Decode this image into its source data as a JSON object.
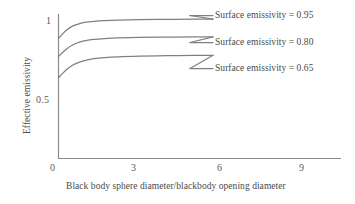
{
  "chart_data": {
    "type": "line",
    "title": "",
    "xlabel": "Black body sphere diameter/blackbody opening diameter",
    "ylabel": "Effective emissivity",
    "xlim": [
      0,
      10.4
    ],
    "ylim": [
      0.4,
      1.06
    ],
    "xticks": [
      0,
      3,
      6,
      9
    ],
    "xtick_labels": [
      "0",
      "3",
      "6",
      "9"
    ],
    "yticks": [
      0.5,
      1
    ],
    "ytick_labels": [
      "0.5",
      "1"
    ],
    "grid": false,
    "legend_position": "inside-right",
    "line_color": "#808080",
    "text_color": "#4a4a4a",
    "axis_color": "#808080",
    "series": [
      {
        "name": "Surface emissivity = 0.95",
        "legend_label": "Surface emissivity = 0.95",
        "surface_emissivity": 0.95,
        "x": [
          0,
          0.15,
          0.3,
          0.5,
          0.75,
          1.0,
          1.3,
          1.7,
          2.2,
          3.0,
          4.0,
          5.0,
          5.7
        ],
        "values": [
          0.885,
          0.915,
          0.94,
          0.963,
          0.979,
          0.989,
          0.995,
          0.999,
          1.002,
          1.005,
          1.007,
          1.008,
          1.009
        ]
      },
      {
        "name": "Surface emissivity = 0.80",
        "legend_label": "Surface emissivity = 0.80",
        "surface_emissivity": 0.8,
        "x": [
          0,
          0.15,
          0.3,
          0.5,
          0.75,
          1.0,
          1.3,
          1.7,
          2.2,
          3.0,
          4.0,
          5.0,
          5.7
        ],
        "values": [
          0.772,
          0.798,
          0.82,
          0.843,
          0.861,
          0.872,
          0.88,
          0.886,
          0.89,
          0.893,
          0.895,
          0.896,
          0.897
        ]
      },
      {
        "name": "Surface emissivity = 0.65",
        "legend_label": "Surface emissivity = 0.65",
        "surface_emissivity": 0.65,
        "x": [
          0,
          0.15,
          0.3,
          0.5,
          0.75,
          1.0,
          1.3,
          1.7,
          2.2,
          3.0,
          4.0,
          5.0,
          5.7
        ],
        "values": [
          0.637,
          0.665,
          0.69,
          0.715,
          0.735,
          0.748,
          0.758,
          0.765,
          0.77,
          0.774,
          0.777,
          0.779,
          0.78
        ]
      }
    ]
  }
}
